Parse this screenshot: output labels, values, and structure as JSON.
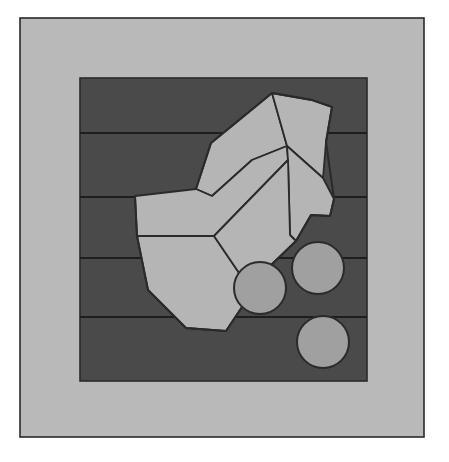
{
  "figure": {
    "canvas": {
      "width": 449,
      "height": 462,
      "background": "#ffffff"
    },
    "palette": {
      "background": "#ffffff",
      "frame_fill": "#b9b9b9",
      "matrix_fill": "#4a4a4a",
      "grain_fill": "#b5b5b5",
      "particle_fill": "#a0a0a0",
      "outline": "#2a2a2a",
      "band_line": "#1e1e1e"
    },
    "outer_frame": {
      "name": "outer-frame",
      "x": 20,
      "y": 18,
      "width": 404,
      "height": 419,
      "fill": "#b9b9b9",
      "stroke": "#2a2a2a",
      "stroke_width": 1.6
    },
    "matrix_field": {
      "name": "matrix-field",
      "x": 80,
      "y": 78,
      "width": 287,
      "height": 303,
      "fill": "#4a4a4a",
      "stroke": "#2a2a2a",
      "stroke_width": 1.6,
      "description": "Dark inner field representing the etched matrix"
    },
    "band_lines": {
      "name": "band-lines",
      "stroke": "#1e1e1e",
      "stroke_width": 2.2,
      "y_positions": [
        133,
        197,
        258,
        317
      ],
      "x_start": 80,
      "x_end": 367,
      "count": 4,
      "description": "Horizontal banding lines crossing the dark matrix"
    },
    "grains": [
      {
        "id": "grain-1",
        "label": "upper-left grain",
        "points": "196,189 211,143 244,116 272,93 287,146 252,160 212,196",
        "fill": "#b5b5b5"
      },
      {
        "id": "grain-2",
        "label": "upper-right grain",
        "points": "272,93 289,96 312,100 332,107 326,142 323,178 287,146",
        "fill": "#b5b5b5"
      },
      {
        "id": "grain-3",
        "label": "left lobe grain",
        "points": "196,189 212,196 252,160 287,146 288,160 214,236 137,236 135,196",
        "fill": "#b5b5b5"
      },
      {
        "id": "grain-4",
        "label": "right wedge grain",
        "points": "287,146 323,178 334,199 330,216 311,215 296,241 290,235 288,160",
        "fill": "#b5b5b5"
      },
      {
        "id": "grain-5",
        "label": "lower-left grain",
        "points": "137,236 214,236 252,292 226,331 186,328 148,290",
        "fill": "#b5b5b5"
      },
      {
        "id": "grain-6",
        "label": "central lower grain",
        "points": "214,236 288,160 290,235 296,241 268,268 252,292",
        "fill": "#b5b5b5"
      }
    ],
    "grain_cluster_outline": {
      "name": "grain-cluster-outline",
      "points": "196,189 211,143 244,116 272,93 289,96 312,100 332,107 326,142 334,199 330,216 311,215 296,241 268,268 252,292 226,331 186,328 148,290 137,236 135,196",
      "stroke": "#2a2a2a",
      "stroke_width": 2.0,
      "description": "Outer boundary of the angular light-gray grain cluster"
    },
    "particles": [
      {
        "id": "particle-left",
        "cx": 260,
        "cy": 288,
        "r": 26,
        "fill": "#a0a0a0"
      },
      {
        "id": "particle-upper-right",
        "cx": 318,
        "cy": 268,
        "r": 26,
        "fill": "#a0a0a0"
      },
      {
        "id": "particle-lower-right",
        "cx": 323,
        "cy": 342,
        "r": 26,
        "fill": "#a0a0a0"
      }
    ],
    "particle_style": {
      "stroke": "#2a2a2a",
      "stroke_width": 2.0,
      "count": 3,
      "description": "Three round second-phase particles in the lower right of the matrix"
    }
  }
}
